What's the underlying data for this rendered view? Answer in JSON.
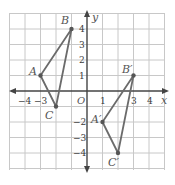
{
  "graph": {
    "x_axis_label": "x",
    "y_axis_label": "y",
    "origin_label": "O",
    "x_tick_labels": [
      "−4",
      "−3",
      "1",
      "3",
      "4"
    ],
    "y_tick_labels": [
      "4",
      "3",
      "2",
      "1",
      "−2",
      "−3",
      "−4"
    ],
    "grid_range": {
      "xmin": -5,
      "xmax": 5,
      "ymin": -5,
      "ymax": 5
    },
    "colors": {
      "grid": "#c8c8c8",
      "axis": "#444444",
      "triangle": "#6b6b6b",
      "point": "#555555"
    }
  },
  "triangles": [
    {
      "name": "ABC",
      "vertices": [
        {
          "label": "A",
          "x": -3,
          "y": 1
        },
        {
          "label": "B",
          "x": -1,
          "y": 4
        },
        {
          "label": "C",
          "x": -2,
          "y": -1
        }
      ]
    },
    {
      "name": "A'B'C'",
      "vertices": [
        {
          "label": "A′",
          "x": 1,
          "y": -2
        },
        {
          "label": "B′",
          "x": 3,
          "y": 1
        },
        {
          "label": "C′",
          "x": 2,
          "y": -4
        }
      ]
    }
  ]
}
